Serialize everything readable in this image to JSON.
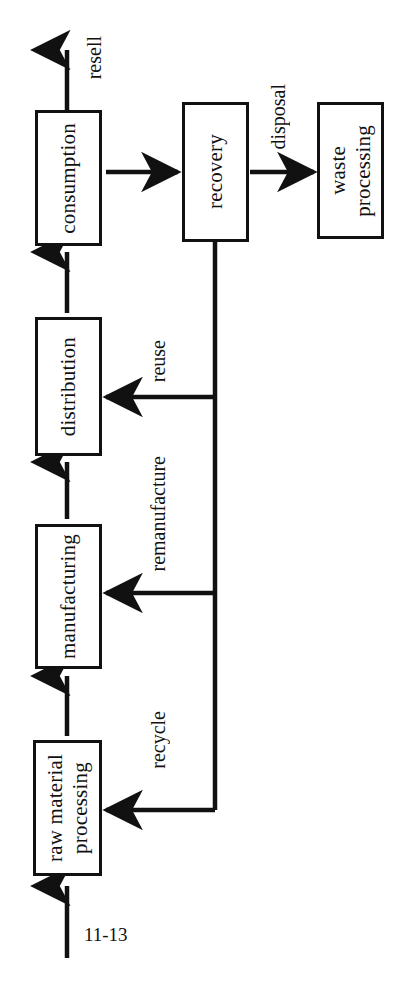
{
  "figure": {
    "number": "11-13",
    "orientation": "rotated-90-ccw",
    "background_color": "#ffffff",
    "line_color": "#111111"
  },
  "nodes": [
    {
      "id": "raw-material-processing",
      "label": "raw material\nprocessing"
    },
    {
      "id": "manufacturing",
      "label": "manufacturing"
    },
    {
      "id": "distribution",
      "label": "distribution"
    },
    {
      "id": "consumption",
      "label": "consumption"
    },
    {
      "id": "recovery",
      "label": "recovery"
    },
    {
      "id": "waste-processing",
      "label": "waste\nprocessing"
    }
  ],
  "edges": [
    {
      "id": "input-to-raw-material",
      "label": "",
      "from": "",
      "to": "raw-material-processing"
    },
    {
      "id": "raw-material-to-manufacturing",
      "label": "",
      "from": "raw-material-processing",
      "to": "manufacturing"
    },
    {
      "id": "manufacturing-to-distribution",
      "label": "",
      "from": "manufacturing",
      "to": "distribution"
    },
    {
      "id": "distribution-to-consumption",
      "label": "",
      "from": "distribution",
      "to": "consumption"
    },
    {
      "id": "consumption-to-recovery",
      "label": "",
      "from": "consumption",
      "to": "recovery"
    },
    {
      "id": "consumption-resell",
      "label": "resell",
      "from": "consumption",
      "to": ""
    },
    {
      "id": "recovery-to-waste-processing",
      "label": "disposal",
      "from": "recovery",
      "to": "waste-processing"
    },
    {
      "id": "recovery-to-distribution",
      "label": "reuse",
      "from": "recovery",
      "to": "distribution"
    },
    {
      "id": "recovery-to-manufacturing",
      "label": "remanufacture",
      "from": "recovery",
      "to": "manufacturing"
    },
    {
      "id": "recovery-to-raw-material",
      "label": "recycle",
      "from": "recovery",
      "to": "raw-material-processing"
    }
  ]
}
